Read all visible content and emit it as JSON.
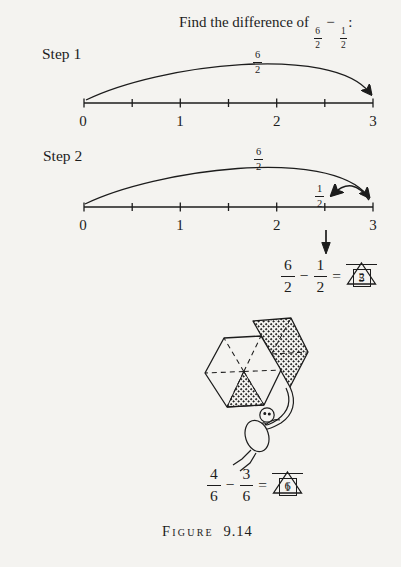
{
  "colors": {
    "ink": "#1c1c1c",
    "paper": "#f4f3f0"
  },
  "title": {
    "prefix": "Find the difference of",
    "fraction1": {
      "num": "6",
      "den": "2"
    },
    "operator": "−",
    "fraction2": {
      "num": "1",
      "den": "2"
    },
    "suffix": ":"
  },
  "step1": {
    "label": "Step 1",
    "arc_label": {
      "num": "6",
      "den": "2"
    },
    "tick_labels": [
      "0",
      "1",
      "2",
      "3"
    ]
  },
  "step2": {
    "label": "Step 2",
    "arc_label": {
      "num": "6",
      "den": "2"
    },
    "jump_back_label": {
      "num": "1",
      "den": "2"
    },
    "tick_labels": [
      "0",
      "1",
      "2",
      "3"
    ]
  },
  "equation1": {
    "minuend": {
      "num": "6",
      "den": "2"
    },
    "operator": "−",
    "subtrahend": {
      "num": "1",
      "den": "2"
    },
    "equals": "=",
    "result": {
      "num": "5",
      "den": "2"
    }
  },
  "equation2": {
    "minuend": {
      "num": "4",
      "den": "6"
    },
    "operator": "−",
    "subtrahend": {
      "num": "3",
      "den": "6"
    },
    "equals": "=",
    "result": {
      "num": "1",
      "den": "6"
    }
  },
  "illustration": {
    "hexagon_total_parts": 6,
    "hexagon_shaded_parts": 1,
    "kite_shaded_parts": 3
  },
  "caption": {
    "label": "Figure",
    "number": "9.14"
  }
}
